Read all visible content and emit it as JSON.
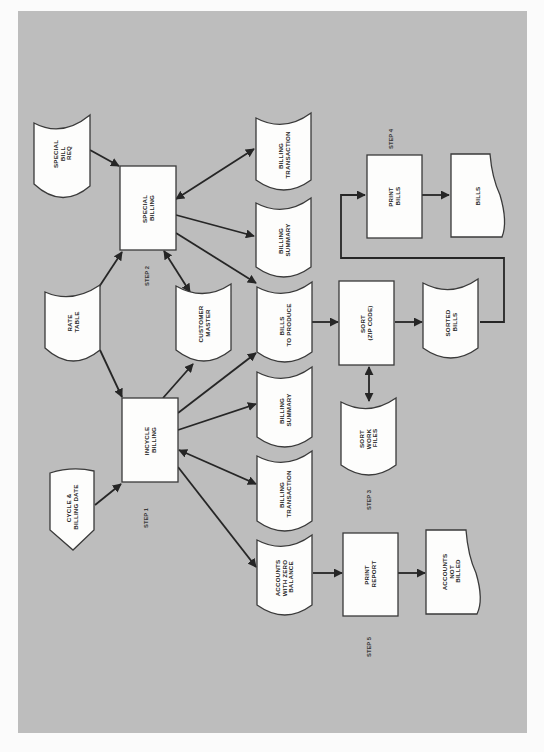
{
  "diagram": {
    "background_color": "#bdbdbd",
    "page_color": "#fbfbfb",
    "orientation": "rotated-90-ccw",
    "steps": [
      {
        "id": "step1",
        "label": "STEP 1"
      },
      {
        "id": "step2",
        "label": "STEP 2"
      },
      {
        "id": "step3",
        "label": "STEP 3"
      },
      {
        "id": "step4",
        "label": "STEP 4"
      },
      {
        "id": "step5",
        "label": "STEP 5"
      }
    ],
    "nodes": [
      {
        "id": "special_bill_req",
        "shape": "punched-card",
        "lines": [
          "SPECIAL",
          "BILL",
          "REQ"
        ]
      },
      {
        "id": "rate_table",
        "shape": "punched-card",
        "lines": [
          "RATE",
          "TABLE"
        ]
      },
      {
        "id": "cycle_billing_date",
        "shape": "manual-input",
        "lines": [
          "CYCLE &",
          "BILLING DATE"
        ]
      },
      {
        "id": "special_billing",
        "shape": "process",
        "lines": [
          "SPECIAL",
          "BILLING"
        ]
      },
      {
        "id": "incycle_billing",
        "shape": "process",
        "lines": [
          "INCYCLE",
          "BILLING"
        ]
      },
      {
        "id": "customer_master",
        "shape": "tape",
        "lines": [
          "CUSTOMER",
          "MASTER"
        ]
      },
      {
        "id": "billing_transaction_2",
        "shape": "tape",
        "lines": [
          "BILLING",
          "TRANSACTION"
        ]
      },
      {
        "id": "billing_summary_2",
        "shape": "tape",
        "lines": [
          "BILLING",
          "SUMMARY"
        ]
      },
      {
        "id": "bills_to_produce",
        "shape": "tape",
        "lines": [
          "BILLS",
          "TO PRODUCE"
        ]
      },
      {
        "id": "billing_summary_1",
        "shape": "tape",
        "lines": [
          "BILLING",
          "SUMMARY"
        ]
      },
      {
        "id": "billing_transaction_1",
        "shape": "tape",
        "lines": [
          "BILLING",
          "TRANSACTION"
        ]
      },
      {
        "id": "accounts_zero_balance",
        "shape": "tape",
        "lines": [
          "ACCOUNTS",
          "WITH ZERO",
          "BALANCE"
        ]
      },
      {
        "id": "sort_zip",
        "shape": "process",
        "lines": [
          "SORT",
          "(ZIP CODE)"
        ]
      },
      {
        "id": "sort_work_files",
        "shape": "tape",
        "lines": [
          "SORT",
          "WORK",
          "FILES"
        ]
      },
      {
        "id": "sorted_bills",
        "shape": "tape",
        "lines": [
          "SORTED",
          "BILLS"
        ]
      },
      {
        "id": "print_bills",
        "shape": "process",
        "lines": [
          "PRINT",
          "BILLS"
        ]
      },
      {
        "id": "bills",
        "shape": "document",
        "lines": [
          "BILLS"
        ]
      },
      {
        "id": "print_report",
        "shape": "process",
        "lines": [
          "PRINT",
          "REPORT"
        ]
      },
      {
        "id": "accounts_not_billed",
        "shape": "document",
        "lines": [
          "ACCOUNTS",
          "NOT",
          "BILLED"
        ]
      }
    ],
    "edges": [
      {
        "from": "special_bill_req",
        "to": "special_billing",
        "type": "directed"
      },
      {
        "from": "rate_table",
        "to": "special_billing",
        "type": "directed"
      },
      {
        "from": "rate_table",
        "to": "incycle_billing",
        "type": "directed"
      },
      {
        "from": "cycle_billing_date",
        "to": "incycle_billing",
        "type": "directed"
      },
      {
        "from": "special_billing",
        "to": "billing_transaction_2",
        "type": "bidirectional"
      },
      {
        "from": "special_billing",
        "to": "billing_summary_2",
        "type": "directed"
      },
      {
        "from": "special_billing",
        "to": "bills_to_produce",
        "type": "directed"
      },
      {
        "from": "special_billing",
        "to": "customer_master",
        "type": "bidirectional"
      },
      {
        "from": "incycle_billing",
        "to": "customer_master",
        "type": "directed"
      },
      {
        "from": "incycle_billing",
        "to": "bills_to_produce",
        "type": "directed"
      },
      {
        "from": "incycle_billing",
        "to": "billing_summary_1",
        "type": "directed"
      },
      {
        "from": "incycle_billing",
        "to": "billing_transaction_1",
        "type": "bidirectional"
      },
      {
        "from": "incycle_billing",
        "to": "accounts_zero_balance",
        "type": "directed"
      },
      {
        "from": "bills_to_produce",
        "to": "sort_zip",
        "type": "directed"
      },
      {
        "from": "sort_zip",
        "to": "sorted_bills",
        "type": "directed"
      },
      {
        "from": "sort_zip",
        "to": "sort_work_files",
        "type": "bidirectional"
      },
      {
        "from": "sorted_bills",
        "to": "print_bills",
        "type": "directed"
      },
      {
        "from": "print_bills",
        "to": "bills",
        "type": "directed"
      },
      {
        "from": "accounts_zero_balance",
        "to": "print_report",
        "type": "directed"
      },
      {
        "from": "print_report",
        "to": "accounts_not_billed",
        "type": "directed"
      }
    ]
  }
}
